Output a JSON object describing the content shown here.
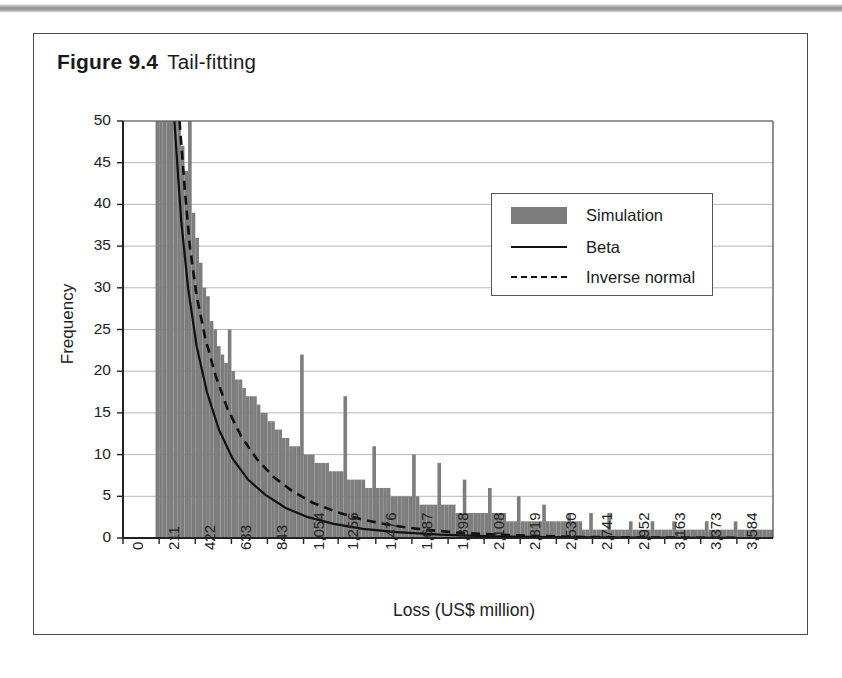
{
  "figure": {
    "number": "Figure 9.4",
    "title": "Tail-fitting"
  },
  "chart_data": {
    "type": "bar",
    "title": "Tail-fitting",
    "xlabel": "Loss (US$ million)",
    "ylabel": "Frequency",
    "ylim": [
      0,
      50
    ],
    "yticks": [
      0,
      5,
      10,
      15,
      20,
      25,
      30,
      35,
      40,
      45,
      50
    ],
    "grid": true,
    "legend_position": "upper-right",
    "xtick_labels": [
      "0",
      "211",
      "422",
      "633",
      "843",
      "1,054",
      "1,256",
      "1,476",
      "1,687",
      "1,898",
      "2,108",
      "2,319",
      "2,530",
      "2,741",
      "2,952",
      "3,163",
      "3,373",
      "3,584"
    ],
    "xtick_values": [
      0,
      211,
      422,
      633,
      843,
      1054,
      1256,
      1476,
      1687,
      1898,
      2108,
      2319,
      2530,
      2741,
      2952,
      3163,
      3373,
      3584
    ],
    "colors": {
      "simulation_fill": "#7d7d7d",
      "beta_line": "#111111",
      "inverse_normal_line": "#111111",
      "grid": "#b8b8b8",
      "axis": "#222222"
    },
    "legend": [
      {
        "label": "Simulation",
        "kind": "area",
        "color": "#7d7d7d"
      },
      {
        "label": "Beta",
        "kind": "line-solid",
        "color": "#111111"
      },
      {
        "label": "Inverse normal",
        "kind": "line-dashed",
        "color": "#111111"
      }
    ],
    "series": [
      {
        "name": "Simulation",
        "kind": "histogram",
        "note": "Histogram clipped at y=50; left-most bin saturates the axis top.",
        "bin_width": 21.1,
        "x_start": 190,
        "values": [
          50,
          50,
          50,
          50,
          50,
          50,
          50,
          47,
          44,
          50,
          39,
          36,
          33,
          30,
          29,
          26,
          25,
          23,
          22,
          21,
          25,
          20,
          19,
          19,
          18,
          17,
          17,
          17,
          16,
          15,
          15,
          14,
          14,
          13,
          13,
          12,
          12,
          11,
          11,
          11,
          22,
          10,
          10,
          10,
          9,
          9,
          9,
          9,
          8,
          8,
          8,
          8,
          17,
          7,
          7,
          7,
          7,
          7,
          6,
          6,
          11,
          6,
          6,
          6,
          6,
          5,
          5,
          5,
          5,
          5,
          5,
          10,
          5,
          4,
          4,
          4,
          4,
          4,
          9,
          4,
          4,
          4,
          4,
          3,
          3,
          7,
          3,
          3,
          3,
          3,
          3,
          3,
          6,
          3,
          3,
          3,
          3,
          2,
          2,
          2,
          5,
          2,
          2,
          2,
          2,
          2,
          2,
          4,
          2,
          2,
          2,
          2,
          2,
          2,
          3,
          2,
          2,
          2,
          1,
          1,
          3,
          1,
          1,
          1,
          1,
          3,
          1,
          1,
          1,
          1,
          1,
          2,
          1,
          1,
          1,
          1,
          1,
          2,
          1,
          1,
          1,
          1,
          1,
          2,
          1,
          1,
          1,
          1,
          1,
          1,
          1,
          1,
          2,
          1,
          1,
          1,
          1,
          1,
          1,
          1,
          2,
          1,
          1,
          1,
          1,
          1,
          1,
          1,
          1,
          1,
          1,
          2,
          1,
          1,
          1,
          1,
          1,
          1,
          1,
          1,
          1,
          1,
          1,
          2,
          1,
          1,
          1,
          1,
          1,
          1,
          0,
          1,
          1,
          1,
          1,
          0,
          1,
          0,
          1,
          1,
          0,
          0,
          1,
          1,
          0,
          0,
          1,
          0,
          0,
          1,
          0,
          0,
          0,
          1,
          0,
          0,
          1,
          0,
          0,
          0,
          1,
          0,
          0,
          0,
          0,
          1,
          0,
          0,
          0,
          1,
          0,
          0,
          0,
          0,
          1,
          0,
          0,
          0,
          0,
          1
        ]
      },
      {
        "name": "Beta",
        "kind": "line",
        "style": "solid",
        "points": [
          [
            300,
            50
          ],
          [
            340,
            38
          ],
          [
            380,
            30
          ],
          [
            430,
            23
          ],
          [
            490,
            17.5
          ],
          [
            560,
            13
          ],
          [
            640,
            9.5
          ],
          [
            730,
            7
          ],
          [
            830,
            5.2
          ],
          [
            950,
            3.6
          ],
          [
            1080,
            2.5
          ],
          [
            1230,
            1.7
          ],
          [
            1400,
            1.1
          ],
          [
            1600,
            0.7
          ],
          [
            1850,
            0.4
          ],
          [
            2150,
            0.2
          ],
          [
            2500,
            0.1
          ],
          [
            3000,
            0.05
          ],
          [
            3584,
            0.02
          ]
        ]
      },
      {
        "name": "Inverse normal",
        "kind": "line",
        "style": "dashed",
        "points": [
          [
            330,
            50
          ],
          [
            360,
            42
          ],
          [
            390,
            35
          ],
          [
            430,
            29
          ],
          [
            480,
            24
          ],
          [
            540,
            19.5
          ],
          [
            610,
            15.5
          ],
          [
            690,
            12.2
          ],
          [
            780,
            9.5
          ],
          [
            880,
            7.3
          ],
          [
            990,
            5.6
          ],
          [
            1110,
            4.2
          ],
          [
            1250,
            3.1
          ],
          [
            1400,
            2.2
          ],
          [
            1570,
            1.5
          ],
          [
            1760,
            1.0
          ],
          [
            1980,
            0.6
          ],
          [
            2250,
            0.35
          ],
          [
            2600,
            0.15
          ],
          [
            3000,
            0.06
          ],
          [
            3584,
            0.02
          ]
        ]
      }
    ]
  }
}
